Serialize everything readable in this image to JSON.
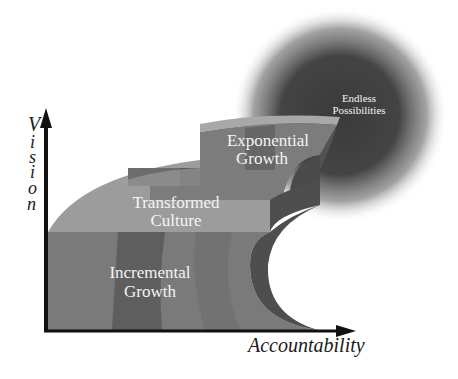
{
  "diagram": {
    "type": "staircase-growth-diagram",
    "axes": {
      "y_label_letters": [
        "V",
        "i",
        "s",
        "i",
        "o",
        "n"
      ],
      "y_label": "Vision",
      "x_label": "Accountability"
    },
    "steps": [
      {
        "id": "incremental",
        "line1": "Incremental",
        "line2": "Growth"
      },
      {
        "id": "transformed",
        "line1": "Transformed",
        "line2": "Culture"
      },
      {
        "id": "exponential",
        "line1": "Exponential",
        "line2": "Growth"
      }
    ],
    "goal": {
      "line1": "Endless",
      "line2": "Possibilities"
    },
    "colors": {
      "front_face": "#7a7a7a",
      "front_face_dark_band": "#5e5e5e",
      "top_face": "#9a9a9a",
      "top_face_light": "#a8a8a8",
      "side_face": "#4e4e4e",
      "glow_center": "#3a3a3a",
      "axis": "#111111",
      "label_text": "#f4f4f4"
    }
  }
}
